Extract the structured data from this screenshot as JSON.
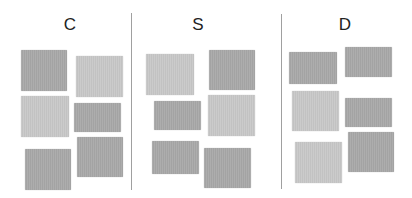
{
  "columns": [
    {
      "label": "C",
      "label_x": 55,
      "tiles": [
        {
          "shade": "dark",
          "x": 21,
          "y": 50,
          "w": 46,
          "h": 41
        },
        {
          "shade": "light",
          "x": 76,
          "y": 56,
          "w": 47,
          "h": 41
        },
        {
          "shade": "light",
          "x": 21,
          "y": 96,
          "w": 48,
          "h": 41
        },
        {
          "shade": "dark",
          "x": 74,
          "y": 103,
          "w": 47,
          "h": 29
        },
        {
          "shade": "dark",
          "x": 25,
          "y": 149,
          "w": 46,
          "h": 41
        },
        {
          "shade": "dark",
          "x": 77,
          "y": 137,
          "w": 46,
          "h": 40
        }
      ]
    },
    {
      "label": "S",
      "label_x": 183,
      "tiles": [
        {
          "shade": "light",
          "x": 146,
          "y": 54,
          "w": 48,
          "h": 41
        },
        {
          "shade": "dark",
          "x": 209,
          "y": 50,
          "w": 46,
          "h": 40
        },
        {
          "shade": "dark",
          "x": 154,
          "y": 101,
          "w": 47,
          "h": 29
        },
        {
          "shade": "light",
          "x": 208,
          "y": 95,
          "w": 47,
          "h": 41
        },
        {
          "shade": "dark",
          "x": 152,
          "y": 141,
          "w": 47,
          "h": 33
        },
        {
          "shade": "dark",
          "x": 204,
          "y": 148,
          "w": 47,
          "h": 40
        }
      ]
    },
    {
      "label": "D",
      "label_x": 330,
      "tiles": [
        {
          "shade": "dark",
          "x": 289,
          "y": 52,
          "w": 48,
          "h": 32
        },
        {
          "shade": "dark",
          "x": 345,
          "y": 47,
          "w": 47,
          "h": 30
        },
        {
          "shade": "light",
          "x": 292,
          "y": 91,
          "w": 47,
          "h": 40
        },
        {
          "shade": "dark",
          "x": 345,
          "y": 98,
          "w": 47,
          "h": 29
        },
        {
          "shade": "light",
          "x": 295,
          "y": 142,
          "w": 47,
          "h": 41
        },
        {
          "shade": "dark",
          "x": 348,
          "y": 132,
          "w": 46,
          "h": 40
        }
      ]
    }
  ],
  "dividers": [
    {
      "x": 131,
      "y1": 13,
      "y2": 190
    },
    {
      "x": 281,
      "y1": 14,
      "y2": 189
    }
  ],
  "colors": {
    "dark_tile": "#a8a8a8",
    "light_tile": "#c8c8c8",
    "divider": "#a0a0a0",
    "label": "#222222"
  }
}
